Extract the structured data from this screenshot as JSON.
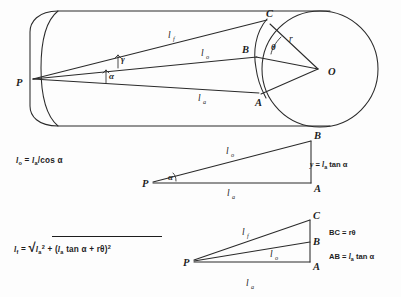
{
  "figure": {
    "background_color": "#fdfdfd",
    "ink_color": "#2a2a2a"
  },
  "main_diagram": {
    "name": "cylinder-with-inscribed-triangles",
    "points": [
      {
        "id": "P",
        "label": "P",
        "x": 22,
        "y": 82
      },
      {
        "id": "C",
        "label": "C",
        "x": 267,
        "y": 19
      },
      {
        "id": "B",
        "label": "B",
        "x": 259,
        "y": 51
      },
      {
        "id": "A",
        "label": "A",
        "x": 258,
        "y": 97
      },
      {
        "id": "O",
        "label": "O",
        "x": 320,
        "y": 71
      }
    ],
    "segment_labels": [
      {
        "id": "lf",
        "base": "l",
        "sub": "f",
        "x": 170,
        "y": 38
      },
      {
        "id": "lo",
        "base": "l",
        "sub": "o",
        "x": 203,
        "y": 56
      },
      {
        "id": "la",
        "base": "l",
        "sub": "a",
        "x": 200,
        "y": 100
      },
      {
        "id": "r",
        "base": "r",
        "sub": "",
        "x": 291,
        "y": 39
      }
    ],
    "angle_labels": [
      {
        "id": "theta",
        "label": "θ",
        "x": 275,
        "y": 46
      },
      {
        "id": "gamma",
        "label": "γ",
        "x": 123,
        "y": 62
      },
      {
        "id": "alpha",
        "label": "α",
        "x": 114,
        "y": 75
      }
    ]
  },
  "triangle_2": {
    "name": "triangle-P-A-B",
    "points": [
      {
        "id": "P",
        "label": "P",
        "x": 146,
        "y": 182
      },
      {
        "id": "B",
        "label": "B",
        "x": 312,
        "y": 140
      },
      {
        "id": "A",
        "label": "A",
        "x": 312,
        "y": 185
      }
    ],
    "segment_labels": [
      {
        "id": "lo",
        "base": "l",
        "sub": "o",
        "x": 228,
        "y": 154
      },
      {
        "id": "la",
        "base": "l",
        "sub": "a",
        "x": 229,
        "y": 194
      }
    ],
    "angle_labels": [
      {
        "id": "alpha",
        "label": "α",
        "x": 170,
        "y": 177
      }
    ]
  },
  "triangle_3": {
    "name": "triangle-P-A-B-C",
    "points": [
      {
        "id": "P",
        "label": "P",
        "x": 188,
        "y": 259
      },
      {
        "id": "C",
        "label": "C",
        "x": 311,
        "y": 219
      },
      {
        "id": "B",
        "label": "B",
        "x": 311,
        "y": 241
      },
      {
        "id": "A",
        "label": "A",
        "x": 311,
        "y": 263
      }
    ],
    "segment_labels": [
      {
        "id": "lf",
        "base": "l",
        "sub": "f",
        "x": 244,
        "y": 235
      },
      {
        "id": "lo",
        "base": "l",
        "sub": "o",
        "x": 272,
        "y": 257
      },
      {
        "id": "la",
        "base": "l",
        "sub": "a",
        "x": 248,
        "y": 284
      }
    ]
  },
  "equations": {
    "eq1": {
      "text": "l_o = l_a/cos α",
      "parts": {
        "lhs_base": "l",
        "lhs_sub": "o",
        "eq": "=",
        "rhs_base": "l",
        "rhs_sub": "a",
        "tail": "/cos α"
      }
    },
    "eq2": {
      "text": "l_f = sqrt( l_a^2 + (l_a tan α + rθ)^2 )",
      "parts": {
        "lhs_base": "l",
        "lhs_sub": "f",
        "eq": "=",
        "radical": "√",
        "term1_base": "l",
        "term1_sub": "a",
        "term1_sup": "2",
        "plus": "+",
        "open": "(",
        "term2_base": "l",
        "term2_sub": "a",
        "term2_tail": "tan α + rθ",
        "close": ")",
        "term2_sup": "2"
      }
    }
  },
  "notes": {
    "note_y": {
      "text": "y = l_a tan α",
      "parts": {
        "lhs": "y",
        "eq": "=",
        "base": "l",
        "sub": "a",
        "tail": "tan α"
      }
    },
    "note_bc": {
      "text": "BC = rθ",
      "parts": {
        "lhs": "BC",
        "eq": "=",
        "tail": "rθ"
      }
    },
    "note_ab": {
      "text": "AB = l_a tan α",
      "parts": {
        "lhs": "AB",
        "eq": "=",
        "base": "l",
        "sub": "a",
        "tail": "tan α"
      }
    }
  }
}
